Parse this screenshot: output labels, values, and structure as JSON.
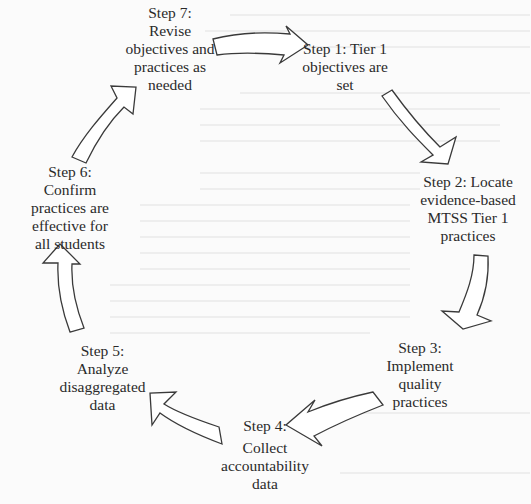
{
  "diagram": {
    "type": "cycle",
    "title": "",
    "steps": [
      {
        "id": "step1",
        "heading": "Step 1: Tier 1",
        "lines": [
          "objectives are",
          "set"
        ]
      },
      {
        "id": "step2",
        "heading": "Step 2: Locate",
        "lines": [
          "evidence-based",
          "MTSS Tier 1",
          "practices"
        ]
      },
      {
        "id": "step3",
        "heading": "Step 3:",
        "lines": [
          "Implement",
          "quality",
          "practices"
        ]
      },
      {
        "id": "step4",
        "heading": "Step 4:",
        "lines": [
          "Collect",
          "accountability",
          "data"
        ]
      },
      {
        "id": "step5",
        "heading": "Step 5:",
        "lines": [
          "Analyze",
          "disaggregated",
          "data"
        ]
      },
      {
        "id": "step6",
        "heading": "Step 6:",
        "lines": [
          "Confirm",
          "practices are",
          "effective for",
          "all students"
        ]
      },
      {
        "id": "step7",
        "heading": "Step 7:",
        "lines": [
          "Revise",
          "objectives and",
          "practices as",
          "needed"
        ]
      }
    ],
    "arrows": [
      {
        "from": "step7",
        "to": "step1"
      },
      {
        "from": "step1",
        "to": "step2"
      },
      {
        "from": "step2",
        "to": "step3"
      },
      {
        "from": "step3",
        "to": "step4"
      },
      {
        "from": "step4",
        "to": "step5"
      },
      {
        "from": "step5",
        "to": "step6"
      },
      {
        "from": "step6",
        "to": "step7"
      }
    ],
    "colors": {
      "background": "#fbfbfb",
      "text": "#2a2a2a",
      "arrow_stroke": "#3a3a3a",
      "arrow_fill": "#ffffff"
    }
  }
}
